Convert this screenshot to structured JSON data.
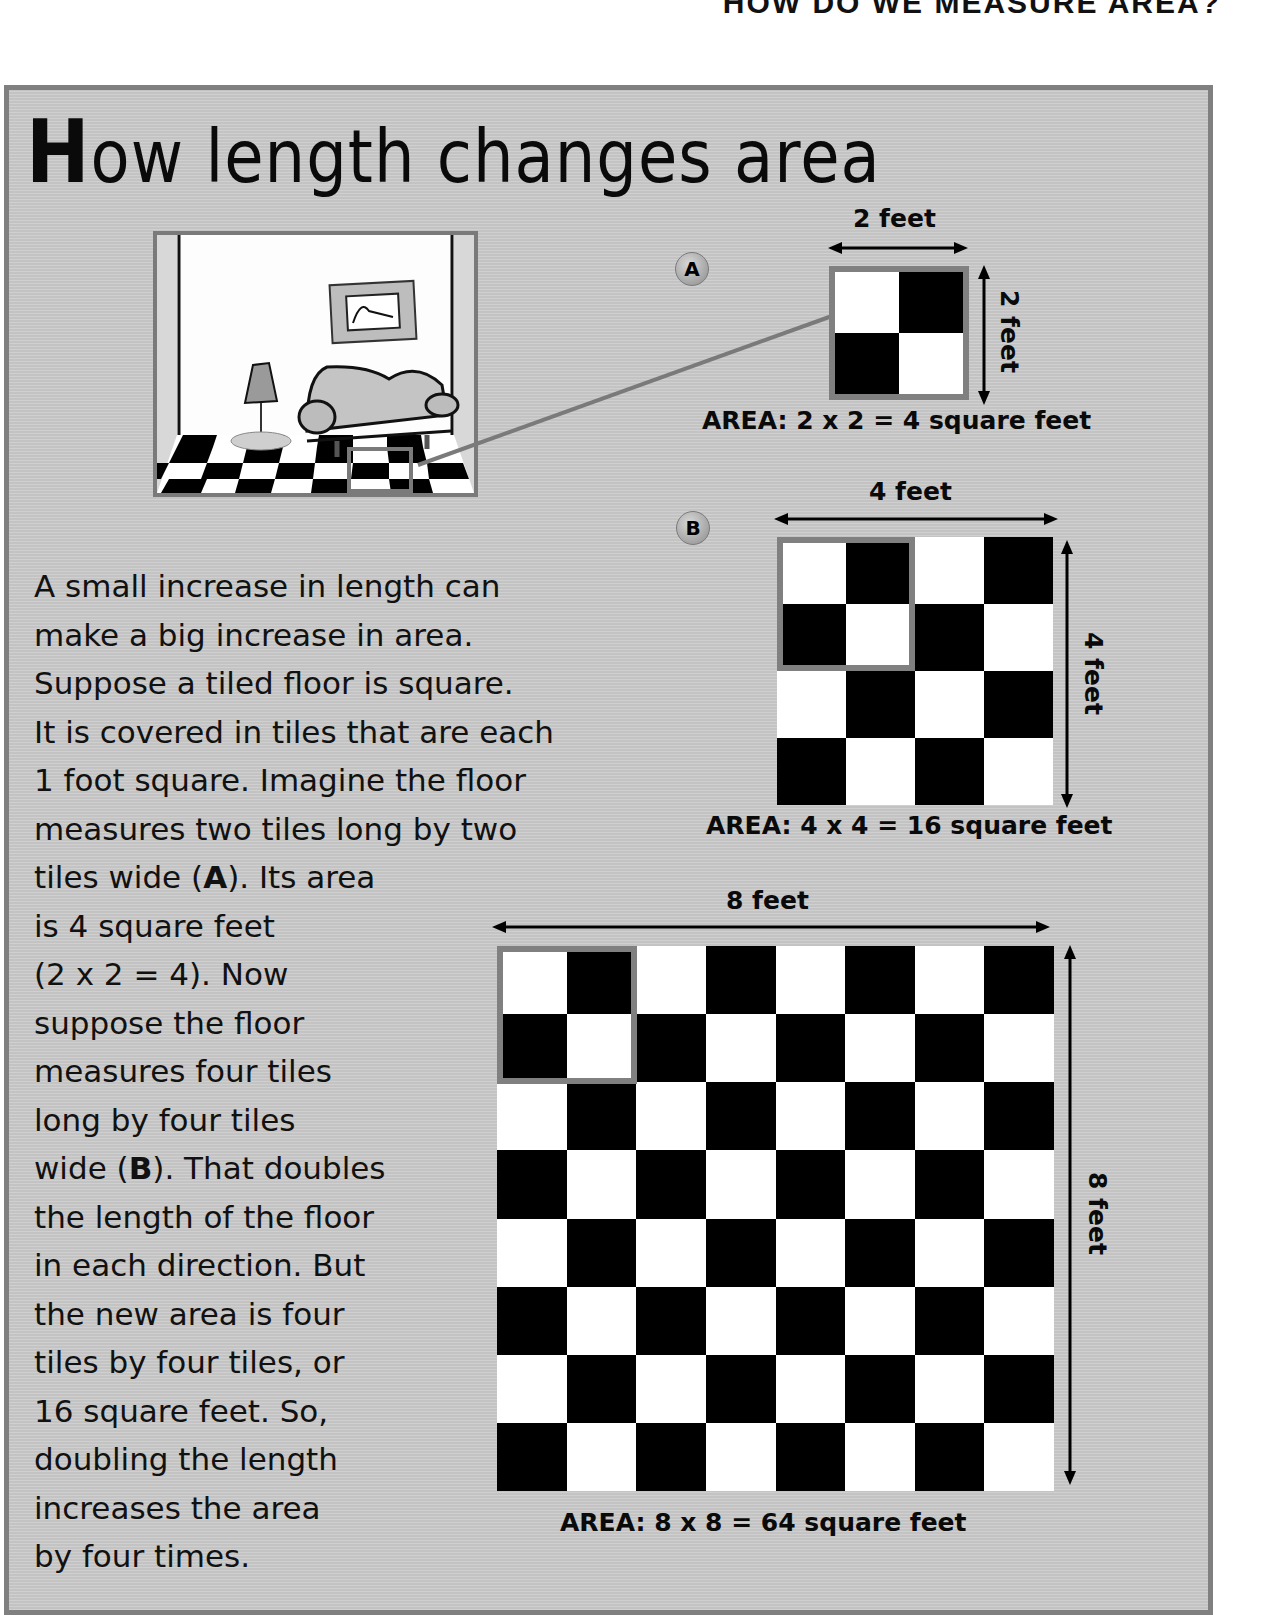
{
  "running_head": "HOW DO WE MEASURE AREA?",
  "title": {
    "cap": "H",
    "rest": "ow length changes area"
  },
  "illustration": {
    "description": "room with sofa, lamp, framed picture and checkered floor; a 2x2 tile patch is highlighted"
  },
  "examples": [
    {
      "marker": "A",
      "width_label": "2 feet",
      "height_label": "2 feet",
      "tiles": 2,
      "area_label": "AREA: 2 x 2 = 4 square feet"
    },
    {
      "marker": "B",
      "width_label": "4 feet",
      "height_label": "4 feet",
      "tiles": 4,
      "area_label": "AREA: 4 x 4 = 16 square feet"
    },
    {
      "marker": "",
      "width_label": "8 feet",
      "height_label": "8 feet",
      "tiles": 8,
      "area_label": "AREA: 8 x 8 = 64 square feet"
    }
  ],
  "body_lines": [
    "A small increase in length can",
    "make a big increase in area.",
    "Suppose a tiled floor is square.",
    "It is covered in tiles that are each",
    "1 foot square. Imagine the floor",
    "measures two tiles long by two",
    [
      "tiles wide (",
      "A",
      "). Its area"
    ],
    "is 4 square feet",
    "(2 x 2 = 4). Now",
    "suppose the floor",
    "measures four tiles",
    "long by four tiles",
    [
      "wide (",
      "B",
      "). That doubles"
    ],
    "the length of the floor",
    "in each direction. But",
    "the new area is four",
    "tiles by four tiles, or",
    "16 square feet. So,",
    "doubling the length",
    "increases the area",
    "by four times."
  ],
  "colors": {
    "panel_bg": "#c9c9c9",
    "panel_border": "#808080",
    "tile_dark": "#000000",
    "tile_light": "#ffffff",
    "highlight": "#808080"
  }
}
